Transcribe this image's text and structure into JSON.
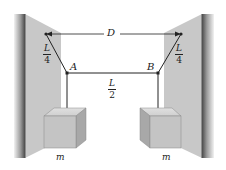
{
  "figure": {
    "labels": {
      "distance": "D",
      "point_a": "A",
      "point_b": "B",
      "mass_left": "m",
      "mass_right": "m"
    },
    "fractions": {
      "left_cable": {
        "numerator": "L",
        "denominator": "4"
      },
      "middle_cable": {
        "numerator": "L",
        "denominator": "2"
      },
      "right_cable": {
        "numerator": "L",
        "denominator": "4"
      }
    },
    "colors": {
      "wall_face": "#c8c8c8",
      "wall_edge": "#555555",
      "box_front": "#c4c4c4",
      "box_top": "#d8d8d8",
      "box_side": "#a8a8a8",
      "line": "#222222"
    }
  }
}
